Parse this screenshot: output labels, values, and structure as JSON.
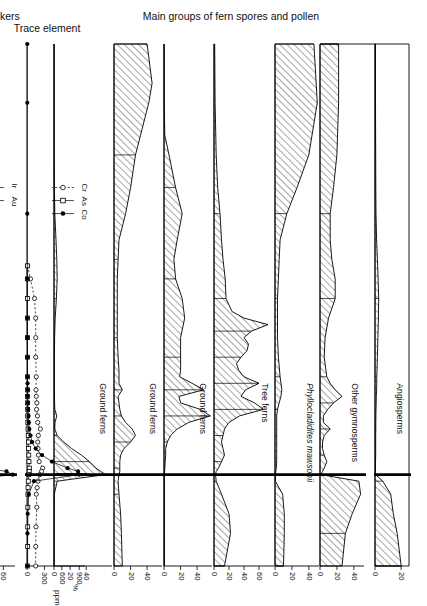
{
  "figure": {
    "orientation": "rotated-90",
    "group_headers": [
      {
        "id": "pollen",
        "label": "Main groups of fern spores and pollen"
      },
      {
        "id": "trace",
        "label": "Trace element"
      },
      {
        "id": "ktm",
        "label": "K/T boundary markers"
      }
    ]
  },
  "depth_axis": {
    "unit_label": "cm",
    "ticks": [
      66,
      60,
      50,
      40,
      30,
      20,
      10,
      0,
      -10,
      -14
    ],
    "tick_labels": [
      "66",
      "60",
      "50",
      "40",
      "30",
      "20",
      "10",
      "0",
      "-10",
      "-14"
    ],
    "range": [
      66,
      -14
    ]
  },
  "stratigraphy": {
    "units": [
      {
        "label": "Early Paleocene",
        "from": 66,
        "to": 0
      },
      {
        "label": "Late Cret.",
        "from": 0,
        "to": -14
      }
    ],
    "lithology": [
      {
        "from": 66,
        "to": 36,
        "pattern": "coal"
      },
      {
        "from": 36,
        "to": 32,
        "pattern": "mudstone-sparse"
      },
      {
        "from": 32,
        "to": 12,
        "pattern": "mudstone-dense"
      },
      {
        "from": 12,
        "to": 11,
        "pattern": "coal"
      },
      {
        "from": 11,
        "to": 8,
        "pattern": "mudstone-sparse"
      },
      {
        "from": 8,
        "to": -4,
        "pattern": "coal"
      },
      {
        "from": -4,
        "to": -14,
        "pattern": "mudstone-dense"
      }
    ]
  },
  "pollen_panels": [
    {
      "id": "angiosperms",
      "title": "Angiosperms",
      "italic": false,
      "axis": {
        "ticks": [
          0,
          20
        ],
        "max": 26,
        "unit": "%"
      },
      "chart_data": {
        "type": "area",
        "xlabel": "Depth (cm)",
        "ylabel": "%",
        "x": [
          66,
          57,
          49,
          44,
          40,
          36,
          33,
          30,
          27,
          24,
          21,
          18,
          15,
          13,
          12,
          11,
          10,
          9,
          8,
          7,
          6,
          5,
          4,
          3,
          2,
          1,
          0.5,
          0,
          -1,
          -3,
          -6,
          -9,
          -14
        ],
        "values": [
          0.4,
          0.4,
          0.5,
          0.6,
          0.8,
          1.2,
          1.8,
          2.4,
          2.8,
          2.6,
          2.2,
          1.8,
          1.4,
          1.2,
          1.0,
          0.9,
          0.8,
          0.7,
          0.6,
          0.6,
          0.5,
          0.5,
          0.5,
          0.5,
          0.4,
          0.4,
          0.4,
          0.4,
          6.0,
          12.0,
          14.0,
          17.0,
          20.0
        ]
      }
    },
    {
      "id": "other-gymnosperms",
      "title": "Other gymnosperms",
      "italic": false,
      "axis": {
        "ticks": [
          0,
          20,
          40
        ],
        "max": 52,
        "unit": "%"
      },
      "chart_data": {
        "type": "area",
        "x": [
          66,
          57,
          49,
          44,
          40,
          36,
          33,
          30,
          27,
          24,
          21,
          18,
          15,
          14,
          13,
          12,
          11,
          10,
          9,
          8,
          7,
          6,
          5,
          4,
          3,
          2,
          1,
          0.5,
          0,
          -1,
          -3,
          -6,
          -9,
          -14
        ],
        "values": [
          22.0,
          22.0,
          20.0,
          16.0,
          12.0,
          12.0,
          14.0,
          18.0,
          18.0,
          10.0,
          6.0,
          5.0,
          8.0,
          12.0,
          18.0,
          26.0,
          16.0,
          9.0,
          4.0,
          4.0,
          12.0,
          5.0,
          3.0,
          3.0,
          5.0,
          8.0,
          5.0,
          3.0,
          1.0,
          46.0,
          48.0,
          38.0,
          30.0,
          26.0
        ]
      }
    },
    {
      "id": "phyllocladidites-mawsonii",
      "title": "Phyllocladidites mawsonii",
      "italic": true,
      "axis": {
        "ticks": [
          0,
          20,
          40
        ],
        "max": 52,
        "unit": "%"
      },
      "chart_data": {
        "type": "area",
        "x": [
          66,
          57,
          49,
          44,
          40,
          36,
          33,
          30,
          27,
          24,
          21,
          18,
          15,
          13,
          12,
          11,
          10,
          9,
          8,
          7,
          6,
          5,
          4,
          3,
          2,
          1,
          0.5,
          0,
          -1,
          -3,
          -6,
          -9,
          -14
        ],
        "values": [
          46.0,
          50.0,
          40.0,
          26.0,
          14.0,
          6.0,
          5.0,
          4.0,
          3.0,
          3.0,
          3.0,
          4.0,
          6.0,
          8.0,
          7.0,
          5.0,
          3.0,
          2.0,
          2.0,
          2.0,
          2.0,
          2.0,
          2.0,
          2.0,
          2.0,
          1.5,
          1.0,
          0.5,
          0.5,
          9.0,
          11.0,
          11.0,
          10.0
        ]
      }
    },
    {
      "id": "tree-ferns",
      "title": "Tree ferns",
      "italic": false,
      "axis": {
        "ticks": [
          0,
          20,
          40,
          60
        ],
        "max": 80,
        "unit": "%"
      },
      "chart_data": {
        "type": "area",
        "x": [
          66,
          57,
          49,
          44,
          40,
          36,
          33,
          30,
          27,
          25,
          24,
          23,
          22,
          21,
          20,
          19,
          18,
          17,
          16,
          15,
          14,
          13,
          12,
          11,
          10,
          9,
          8,
          7,
          6,
          5,
          4,
          3,
          2,
          1,
          0.5,
          0,
          -1,
          -3,
          -6,
          -9,
          -14
        ],
        "values": [
          1.0,
          1.5,
          3.0,
          5.0,
          8.0,
          10.0,
          12.0,
          15.0,
          16.0,
          24.0,
          40.0,
          72.0,
          50.0,
          40.0,
          46.0,
          44.0,
          36.0,
          30.0,
          33.0,
          40.0,
          60.0,
          42.0,
          36.0,
          54.0,
          66.0,
          34.0,
          20.0,
          14.0,
          12.0,
          10.0,
          12.0,
          14.0,
          10.0,
          6.0,
          3.0,
          2.0,
          3.0,
          10.0,
          20.0,
          22.0,
          14.0
        ]
      }
    },
    {
      "id": "ground-ferns-1",
      "title": "Ground ferns",
      "italic": false,
      "axis": {
        "ticks": [
          0,
          20,
          40
        ],
        "max": 58,
        "unit": "%"
      },
      "chart_data": {
        "type": "area",
        "x": [
          66,
          57,
          52,
          49,
          44,
          40,
          36,
          33,
          30,
          27,
          24,
          21,
          18,
          16,
          15,
          14,
          13,
          12,
          11,
          10,
          9,
          8,
          7,
          6,
          5,
          4,
          3,
          2,
          1,
          0.5,
          0,
          -1,
          -3,
          -6,
          -9,
          -14
        ],
        "values": [
          0.3,
          0.3,
          1.0,
          6.0,
          14.0,
          22.0,
          16.0,
          12.0,
          14.0,
          22.0,
          25.0,
          20.0,
          20.0,
          20.0,
          19.0,
          34.0,
          48.0,
          18.0,
          20.0,
          44.0,
          56.0,
          30.0,
          16.0,
          8.0,
          4.0,
          2.0,
          2.0,
          1.5,
          1.0,
          0.8,
          0.5,
          0.5,
          0.5,
          0.5,
          0.5,
          0.5
        ]
      }
    },
    {
      "id": "ground-ferns-2",
      "title": "Ground ferns",
      "italic": false,
      "axis": {
        "ticks": [
          0,
          20,
          40
        ],
        "max": 58,
        "unit": "%"
      },
      "chart_data": {
        "type": "area",
        "x": [
          66,
          60,
          57,
          52,
          49,
          44,
          40,
          36,
          33,
          30,
          27,
          24,
          21,
          18,
          16,
          14,
          13,
          12,
          11,
          10,
          9,
          8,
          7,
          6,
          5,
          4,
          3,
          2,
          1,
          0.5,
          0,
          -1,
          -3,
          -6,
          -9,
          -14
        ],
        "values": [
          40.0,
          46.0,
          42.0,
          32.0,
          26.0,
          20.0,
          14.0,
          6.0,
          5.0,
          4.0,
          4.0,
          4.0,
          4.0,
          5.0,
          6.0,
          6.0,
          10.0,
          5.0,
          6.0,
          7.0,
          9.0,
          14.0,
          22.0,
          26.0,
          20.0,
          12.0,
          8.0,
          7.0,
          7.0,
          7.0,
          6.0,
          5.0,
          6.0,
          8.0,
          9.0,
          10.0
        ]
      }
    },
    {
      "id": "ground-ferns-3",
      "title": "Ground ferns",
      "italic": false,
      "axis": {
        "ticks": [
          0,
          20,
          40
        ],
        "max": 72,
        "unit": "%"
      },
      "chart_data": {
        "type": "area",
        "x": [
          66,
          57,
          49,
          44,
          40,
          36,
          33,
          30,
          27,
          24,
          21,
          18,
          15,
          13,
          12,
          11,
          10,
          9,
          8,
          7,
          6,
          5,
          4,
          3,
          2,
          1,
          0.5,
          0,
          -1,
          -3,
          -6,
          -9,
          -14
        ],
        "values": [
          0.2,
          0.2,
          0.3,
          0.5,
          1.0,
          2.5,
          3.5,
          4.0,
          3.0,
          1.5,
          0.8,
          0.5,
          0.5,
          0.5,
          0.6,
          0.8,
          1.0,
          3.5,
          1.2,
          1.0,
          4.0,
          12.0,
          22.0,
          34.0,
          44.0,
          52.0,
          58.0,
          64.0,
          4.0,
          0.4,
          0.3,
          0.3,
          0.3
        ]
      }
    }
  ],
  "trace_panels": [
    {
      "id": "cr-as-co",
      "axis": {
        "ticks": [
          0,
          300,
          600,
          900
        ],
        "max": 1000,
        "unit": "ppm"
      },
      "legend": [
        {
          "label": "Cr",
          "marker": "open-circle",
          "line": "dashed"
        },
        {
          "label": "As",
          "marker": "open-square",
          "line": "solid"
        },
        {
          "label": "Co",
          "marker": "filled-circle",
          "line": "solid"
        }
      ],
      "chart_data": {
        "type": "line",
        "ylabel": "ppm",
        "ylim": [
          0,
          1000
        ],
        "series": [
          {
            "name": "Cr",
            "marker": "open-circle",
            "x": [
              32,
              30,
              27,
              24,
              21,
              18,
              15,
              13,
              12,
              11,
              10,
              9,
              8,
              7,
              6,
              5,
              4,
              3,
              2,
              1,
              0.5,
              0,
              -1,
              -2,
              -3,
              -5,
              -8,
              -11,
              -14
            ],
            "values": [
              10,
              60,
              130,
              150,
              150,
              150,
              160,
              155,
              160,
              170,
              165,
              180,
              185,
              230,
              195,
              185,
              190,
              195,
              210,
              270,
              250,
              220,
              190,
              175,
              160,
              170,
              155,
              150,
              150
            ]
          },
          {
            "name": "As",
            "marker": "open-square",
            "x": [
              32,
              30,
              27,
              24,
              21,
              18,
              15,
              13,
              12,
              11,
              10,
              9,
              8,
              7,
              6,
              5,
              4,
              3,
              2,
              1,
              0.5,
              0,
              -1,
              -2,
              -3,
              -5,
              -8,
              -11,
              -14
            ],
            "values": [
              6,
              6,
              7,
              7,
              8,
              8,
              9,
              9,
              10,
              10,
              11,
              12,
              14,
              18,
              22,
              24,
              26,
              30,
              34,
              40,
              38,
              30,
              22,
              18,
              16,
              14,
              12,
              11,
              10
            ]
          },
          {
            "name": "Co",
            "marker": "filled-circle",
            "x": [
              66,
              57,
              40,
              30,
              24,
              21,
              18,
              15,
              14,
              13,
              12,
              11,
              10,
              9,
              8,
              7,
              6,
              5,
              4,
              3,
              2,
              1,
              0.5,
              0,
              -1,
              -3,
              -6,
              -9,
              -14
            ],
            "values": [
              5,
              5,
              5,
              6,
              6,
              7,
              8,
              9,
              10,
              14,
              12,
              16,
              20,
              25,
              30,
              40,
              60,
              90,
              150,
              260,
              430,
              700,
              880,
              900,
              120,
              30,
              12,
              8,
              6
            ]
          }
        ]
      }
    },
    {
      "id": "ir-au",
      "axis": {
        "ticks": [
          0,
          20,
          40,
          60
        ],
        "max": 75,
        "unit": "ppb"
      },
      "legend": [
        {
          "label": "Ir",
          "marker": "filled-circle",
          "line": "solid"
        },
        {
          "label": "Au",
          "marker": "open-square",
          "line": "solid"
        }
      ],
      "chart_data": {
        "type": "line",
        "ylabel": "ppb",
        "ylim": [
          0,
          75
        ],
        "series": [
          {
            "name": "Ir",
            "marker": "filled-circle",
            "x": [
              66,
              57,
              40,
              30,
              24,
              21,
              18,
              15,
              14,
              13,
              12,
              11,
              10,
              9,
              8,
              7,
              6,
              5,
              4,
              3,
              2,
              1,
              0.5,
              0,
              -1,
              -3,
              -6,
              -9,
              -14
            ],
            "values": [
              0.3,
              0.3,
              0.3,
              0.3,
              0.3,
              0.3,
              0.3,
              0.4,
              0.4,
              0.5,
              0.5,
              0.6,
              0.6,
              0.7,
              0.8,
              0.9,
              1.0,
              1.5,
              2.5,
              6.0,
              18.0,
              37.0,
              64.0,
              72.0,
              3.0,
              0.8,
              0.5,
              0.4,
              0.3
            ]
          },
          {
            "name": "Au",
            "marker": "open-square",
            "x": [
              2,
              1,
              0.5,
              0,
              -1
            ],
            "values": [
              0.5,
              1.0,
              2.0,
              3.0,
              0.8
            ]
          }
        ]
      }
    }
  ]
}
